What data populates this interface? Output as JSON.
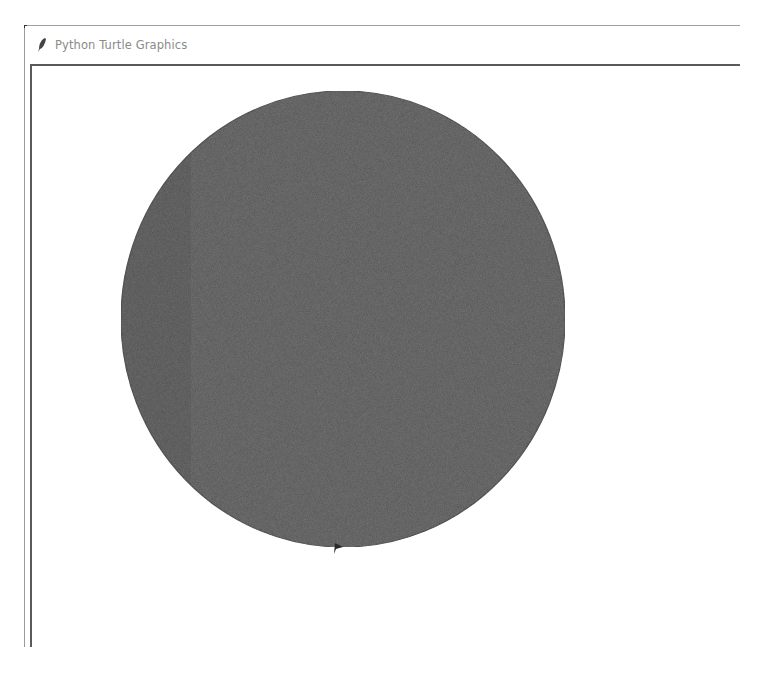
{
  "window": {
    "title": "Python Turtle Graphics",
    "icon": "feather-icon"
  },
  "canvas": {
    "background": "#ffffff",
    "shapes": [
      {
        "type": "filled-circle",
        "fill": "#555555",
        "outline": "#3a3a3a",
        "center_px": [
          343,
          319
        ],
        "radius_x_px": 222,
        "radius_y_px": 228
      }
    ],
    "turtle": {
      "shape": "arrow",
      "color": "#2a2a2a",
      "position_px": [
        337,
        548
      ],
      "heading": "east"
    }
  }
}
